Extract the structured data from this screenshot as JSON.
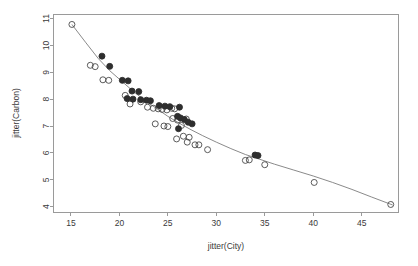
{
  "chart_data": {
    "type": "scatter",
    "title": "",
    "xlabel": "jitter(City)",
    "ylabel": "jitter(Carbon)",
    "xlim": [
      13.2,
      48.8
    ],
    "ylim": [
      3.8,
      11.15
    ],
    "xticks": [
      15,
      20,
      25,
      30,
      35,
      40,
      45
    ],
    "xticklabels": [
      "15",
      "20",
      "25",
      "30",
      "35",
      "40",
      "45"
    ],
    "yticks": [
      4,
      5,
      6,
      7,
      8,
      9,
      10,
      11
    ],
    "yticklabels": [
      "4",
      "5",
      "6",
      "7",
      "8",
      "9",
      "10",
      "11"
    ],
    "grid": false,
    "legend": null,
    "point_style": {
      "open_marker": "circle-open",
      "filled_marker": "circle-filled",
      "radius_px": 3.0,
      "open_color": "#4a4a4a",
      "filled_color": "#2e2e2e"
    },
    "line": {
      "name": "smooth-fit",
      "color": "#7d7d7d",
      "x": [
        15.1,
        16.5,
        17.8,
        19.0,
        20.2,
        21.4,
        22.6,
        23.8,
        25.0,
        26.2,
        27.4,
        28.6,
        30.0,
        31.5,
        33.0,
        34.5,
        36.0,
        38.0,
        40.0,
        42.0,
        44.0,
        46.0,
        48.2
      ],
      "y": [
        10.78,
        10.12,
        9.52,
        9.06,
        8.68,
        8.3,
        7.96,
        7.66,
        7.36,
        7.1,
        6.86,
        6.64,
        6.4,
        6.16,
        5.94,
        5.76,
        5.58,
        5.36,
        5.14,
        4.9,
        4.64,
        4.36,
        4.06
      ]
    },
    "series": [
      {
        "name": "open-circles",
        "marker": "circle-open",
        "points": [
          [
            15.1,
            10.78
          ],
          [
            17.0,
            9.26
          ],
          [
            17.5,
            9.21
          ],
          [
            18.3,
            8.72
          ],
          [
            18.9,
            8.7
          ],
          [
            20.6,
            8.14
          ],
          [
            21.1,
            7.82
          ],
          [
            22.2,
            7.9
          ],
          [
            22.9,
            7.7
          ],
          [
            23.5,
            7.66
          ],
          [
            24.0,
            7.64
          ],
          [
            24.4,
            7.62
          ],
          [
            24.9,
            7.6
          ],
          [
            25.4,
            7.66
          ],
          [
            25.7,
            7.64
          ],
          [
            23.7,
            7.08
          ],
          [
            24.6,
            7.0
          ],
          [
            25.0,
            6.98
          ],
          [
            25.5,
            7.28
          ],
          [
            26.0,
            7.22
          ],
          [
            26.4,
            7.02
          ],
          [
            26.9,
            7.26
          ],
          [
            26.6,
            6.62
          ],
          [
            27.2,
            6.58
          ],
          [
            25.9,
            6.52
          ],
          [
            27.0,
            6.4
          ],
          [
            27.8,
            6.3
          ],
          [
            28.2,
            6.3
          ],
          [
            29.1,
            6.12
          ],
          [
            33.0,
            5.72
          ],
          [
            35.0,
            5.56
          ],
          [
            33.4,
            5.74
          ],
          [
            40.1,
            4.9
          ],
          [
            48.0,
            4.08
          ]
        ]
      },
      {
        "name": "filled-circles",
        "marker": "circle-filled",
        "points": [
          [
            18.2,
            9.6
          ],
          [
            19.0,
            9.22
          ],
          [
            20.3,
            8.7
          ],
          [
            20.9,
            8.68
          ],
          [
            21.3,
            8.3
          ],
          [
            22.0,
            8.28
          ],
          [
            20.8,
            8.02
          ],
          [
            21.4,
            8.0
          ],
          [
            22.2,
            7.98
          ],
          [
            22.8,
            7.96
          ],
          [
            23.2,
            7.94
          ],
          [
            24.1,
            7.76
          ],
          [
            24.7,
            7.74
          ],
          [
            25.2,
            7.72
          ],
          [
            26.2,
            7.7
          ],
          [
            26.0,
            7.36
          ],
          [
            26.3,
            7.3
          ],
          [
            26.7,
            7.24
          ],
          [
            27.1,
            7.14
          ],
          [
            27.5,
            7.08
          ],
          [
            26.1,
            6.9
          ],
          [
            34.0,
            5.92
          ],
          [
            34.3,
            5.9
          ]
        ]
      }
    ]
  },
  "axis": {
    "x_title": "jitter(City)",
    "y_title": "jitter(Carbon)"
  }
}
